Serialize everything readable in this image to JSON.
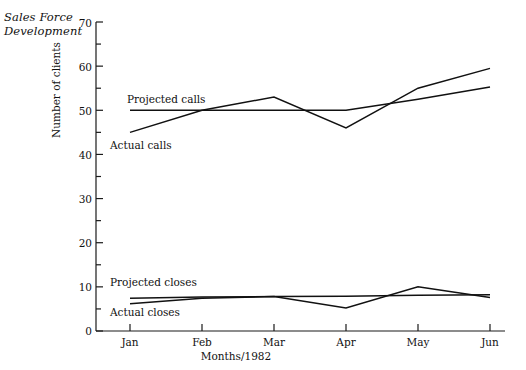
{
  "figure": {
    "title_line1": "Sales Force",
    "title_line2": "Development"
  },
  "axes": {
    "ylabel": "Number of clients",
    "xlabel": "Months/1982",
    "ytick_labels": [
      "0",
      "10",
      "20",
      "30",
      "40",
      "50",
      "60",
      "70"
    ],
    "xtick_labels": [
      "Jan",
      "Feb",
      "Mar",
      "Apr",
      "May",
      "Jun"
    ]
  },
  "series_labels": {
    "projected_calls": "Projected calls",
    "actual_calls": "Actual calls",
    "projected_closes": "Projected closes",
    "actual_closes": "Actual closes"
  },
  "chart_data": {
    "type": "line",
    "title": "Sales Force Development",
    "xlabel": "Months/1982",
    "ylabel": "Number of clients",
    "categories": [
      "Jan",
      "Feb",
      "Mar",
      "Apr",
      "May",
      "Jun"
    ],
    "ylim": [
      0,
      70
    ],
    "ytick_major_step": 10,
    "ytick_minor_step": 5,
    "grid": false,
    "legend": "inline-labels",
    "line_color": "#111111",
    "series": [
      {
        "name": "Projected calls",
        "values": [
          50,
          50,
          50,
          50,
          52.5,
          55.3
        ]
      },
      {
        "name": "Actual calls",
        "values": [
          45,
          50,
          53,
          46,
          55,
          59.5
        ]
      },
      {
        "name": "Projected closes",
        "values": [
          7.4,
          7.7,
          7.8,
          7.9,
          8.1,
          8.2
        ]
      },
      {
        "name": "Actual closes",
        "values": [
          6.2,
          7.4,
          7.8,
          5.2,
          10,
          7.6
        ]
      }
    ]
  }
}
